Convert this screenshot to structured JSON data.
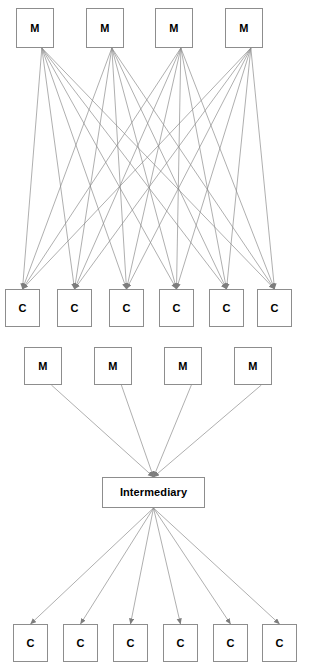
{
  "diagram": {
    "type": "network-topology-comparison",
    "background_color": "#ffffff",
    "line_color": "#8d8d8d",
    "box_border_color": "#8d8d8d",
    "box_fill_color": "#ffffff",
    "text_color": "#000000",
    "panels": [
      {
        "id": "point-to-point",
        "name": "point-to-point-mesh",
        "producer_count": 4,
        "consumer_count": 6,
        "connection_count": 24,
        "topology": "full-mesh"
      },
      {
        "id": "intermediary",
        "name": "hub-and-spoke",
        "producer_count": 4,
        "consumer_count": 6,
        "connection_count": 10,
        "topology": "star-via-broker"
      }
    ]
  },
  "nodes": {
    "top_producers": [
      {
        "label": "M",
        "x": 16,
        "y": 8,
        "w": 38,
        "h": 40
      },
      {
        "label": "M",
        "x": 86,
        "y": 8,
        "w": 38,
        "h": 40
      },
      {
        "label": "M",
        "x": 155,
        "y": 8,
        "w": 38,
        "h": 40
      },
      {
        "label": "M",
        "x": 225,
        "y": 8,
        "w": 38,
        "h": 40
      }
    ],
    "top_consumers": [
      {
        "label": "C",
        "x": 5,
        "y": 289,
        "w": 35,
        "h": 38
      },
      {
        "label": "C",
        "x": 57,
        "y": 289,
        "w": 35,
        "h": 38
      },
      {
        "label": "C",
        "x": 109,
        "y": 289,
        "w": 35,
        "h": 38
      },
      {
        "label": "C",
        "x": 159,
        "y": 289,
        "w": 35,
        "h": 38
      },
      {
        "label": "C",
        "x": 209,
        "y": 289,
        "w": 35,
        "h": 38
      },
      {
        "label": "C",
        "x": 257,
        "y": 289,
        "w": 35,
        "h": 38
      }
    ],
    "bottom_producers": [
      {
        "label": "M",
        "x": 24,
        "y": 347,
        "w": 38,
        "h": 38
      },
      {
        "label": "M",
        "x": 94,
        "y": 347,
        "w": 38,
        "h": 38
      },
      {
        "label": "M",
        "x": 164,
        "y": 347,
        "w": 38,
        "h": 38
      },
      {
        "label": "M",
        "x": 234,
        "y": 347,
        "w": 38,
        "h": 38
      }
    ],
    "intermediary": {
      "label": "Intermediary",
      "x": 102,
      "y": 477,
      "w": 103,
      "h": 31
    },
    "bottom_consumers": [
      {
        "label": "C",
        "x": 13,
        "y": 624,
        "w": 35,
        "h": 38
      },
      {
        "label": "C",
        "x": 63,
        "y": 624,
        "w": 35,
        "h": 38
      },
      {
        "label": "C",
        "x": 113,
        "y": 624,
        "w": 35,
        "h": 38
      },
      {
        "label": "C",
        "x": 163,
        "y": 624,
        "w": 35,
        "h": 38
      },
      {
        "label": "C",
        "x": 213,
        "y": 624,
        "w": 35,
        "h": 38
      },
      {
        "label": "C",
        "x": 262,
        "y": 624,
        "w": 35,
        "h": 38
      }
    ]
  }
}
